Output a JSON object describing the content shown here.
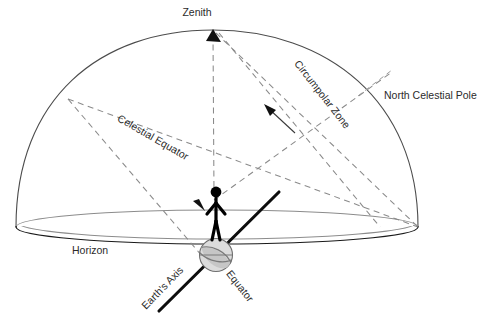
{
  "diagram": {
    "labels": {
      "zenith": "Zenith",
      "north_celestial_pole": "North Celestial Pole",
      "circumpolar_zone": "Circumpolar Zone",
      "celestial_equator": "Celestial Equator",
      "horizon": "Horizon",
      "earths_axis": "Earth's Axis",
      "equator": "Equator"
    },
    "colors": {
      "background": "#ffffff",
      "text": "#2b2b2b",
      "dome_outline": "#4c4c4c",
      "horizon_front": "#1a1a1a",
      "horizon_back": "#8c8c8c",
      "dashed_guide": "#8a8a8a",
      "earth_axis": "#0d0d0d",
      "globe_fill": "#dcdcdc",
      "globe_stroke": "#6e6e6e",
      "figure": "#000000"
    },
    "geometry": {
      "dome_left_x": 16,
      "dome_right_x": 418,
      "dome_apex_x": 213,
      "dome_apex_y": 30,
      "horizon_center_y": 227,
      "horizon_ellipse_ry": 17,
      "globe_center_x": 216,
      "globe_center_y": 255,
      "globe_radius": 17
    },
    "label_rotations": {
      "circumpolar_zone": 52,
      "celestial_equator": 30,
      "earths_axis": -46,
      "equator": 52
    }
  }
}
